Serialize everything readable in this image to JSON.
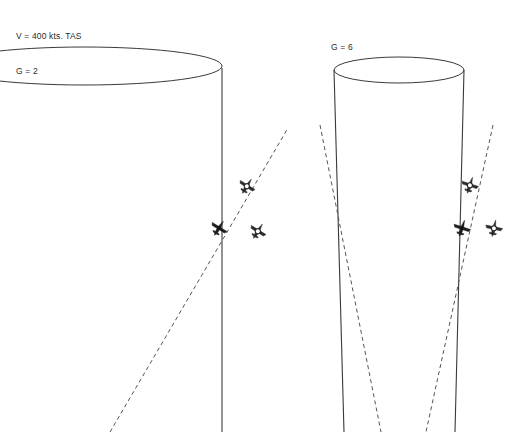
{
  "figure": {
    "background_color": "#ffffff",
    "line_color": "#3a3a3a",
    "dash_color": "#555555",
    "width": 516,
    "height": 434
  },
  "clipped_top_text": "",
  "panels": [
    {
      "id": "left-panel",
      "name": "g2-panel",
      "annotation_lines": [
        "V = 400 kts. TAS",
        "G = 2"
      ],
      "speed_value": "400",
      "speed_units": "kts. TAS",
      "load_factor_label": "G = 2",
      "load_factor": 2,
      "cone": {
        "type": "cylinder-cone",
        "ellipse_center_x": 84,
        "ellipse_center_y": 66,
        "ellipse_rx": 138,
        "ellipse_ry": 19,
        "left_clipped": true,
        "axis_x_top": 222,
        "axis_x_bottom": 222,
        "axis_y_top": 70,
        "axis_y_bottom": 432
      },
      "dashed_paths": [
        {
          "name": "turn-radius-line",
          "x1": 110,
          "y1": 432,
          "x2": 288,
          "y2": 128
        }
      ],
      "aircraft": [
        {
          "name": "aircraft-symbol-target",
          "style": "filled",
          "x": 219,
          "y": 228,
          "rotation": -58,
          "size": 17
        },
        {
          "name": "aircraft-symbol-upper",
          "style": "outline",
          "x": 247,
          "y": 186,
          "rotation": -58,
          "size": 17
        },
        {
          "name": "aircraft-symbol-offset",
          "style": "outline",
          "x": 258,
          "y": 231,
          "rotation": -58,
          "size": 17
        }
      ]
    },
    {
      "id": "right-panel",
      "name": "g6-panel",
      "annotation_lines": [
        "G = 6"
      ],
      "load_factor_label": "G = 6",
      "load_factor": 6,
      "cone": {
        "type": "cylinder-cone",
        "ellipse_center_x": 399,
        "ellipse_center_y": 70,
        "ellipse_rx": 65,
        "ellipse_ry": 13,
        "left_clipped": false,
        "side_left_top_x": 334,
        "side_left_bottom_x": 344,
        "side_right_top_x": 464,
        "side_right_bottom_x": 455,
        "side_y_top": 70,
        "side_y_bottom": 432
      },
      "dashed_paths": [
        {
          "name": "turn-cone-left-edge",
          "x1": 320,
          "y1": 125,
          "x2": 381,
          "y2": 432
        },
        {
          "name": "turn-cone-right-edge",
          "x1": 493,
          "y1": 125,
          "x2": 426,
          "y2": 432
        }
      ],
      "aircraft": [
        {
          "name": "aircraft-symbol-target",
          "style": "filled",
          "x": 462,
          "y": 228,
          "rotation": -72,
          "size": 17
        },
        {
          "name": "aircraft-symbol-upper",
          "style": "outline",
          "x": 470,
          "y": 185,
          "rotation": -72,
          "size": 17
        },
        {
          "name": "aircraft-symbol-offset",
          "style": "outline",
          "x": 494,
          "y": 228,
          "rotation": -78,
          "size": 17
        }
      ]
    }
  ],
  "chart_data": {
    "type": "diagram",
    "series": [
      {
        "name": "G = 2",
        "load_factor": 2,
        "airspeed_kts_tas": 400,
        "cone_half_angle_relative": "wide"
      },
      {
        "name": "G = 6",
        "load_factor": 6,
        "airspeed_kts_tas": 400,
        "cone_half_angle_relative": "narrow"
      }
    ],
    "annotations": [
      "V = 400 kts. TAS",
      "G = 2",
      "G = 6"
    ]
  }
}
